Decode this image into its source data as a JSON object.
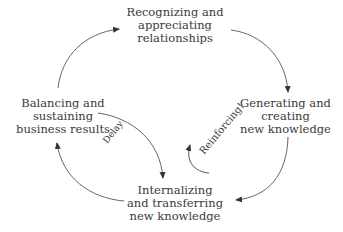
{
  "diagram": {
    "type": "causal-loop",
    "nodes": [
      {
        "id": "top",
        "lines": [
          "Recognizing and",
          "appreciating",
          "relationships"
        ]
      },
      {
        "id": "right",
        "lines": [
          "Generating and",
          "creating",
          "new knowledge"
        ]
      },
      {
        "id": "bottom",
        "lines": [
          "Internalizing",
          "and transferring",
          "new knowledge"
        ]
      },
      {
        "id": "left",
        "lines": [
          "Balancing and",
          "sustaining",
          "business results"
        ]
      }
    ],
    "edges": [
      {
        "from": "left",
        "to": "top"
      },
      {
        "from": "top",
        "to": "right"
      },
      {
        "from": "right",
        "to": "bottom"
      },
      {
        "from": "bottom",
        "to": "left"
      },
      {
        "from": "left",
        "to": "bottom",
        "label": "Delay"
      }
    ],
    "labels": {
      "delay": "Delay",
      "loop": "Reinforcing!"
    },
    "colors": {
      "text": "#3a3a3a",
      "line": "#555555"
    }
  }
}
